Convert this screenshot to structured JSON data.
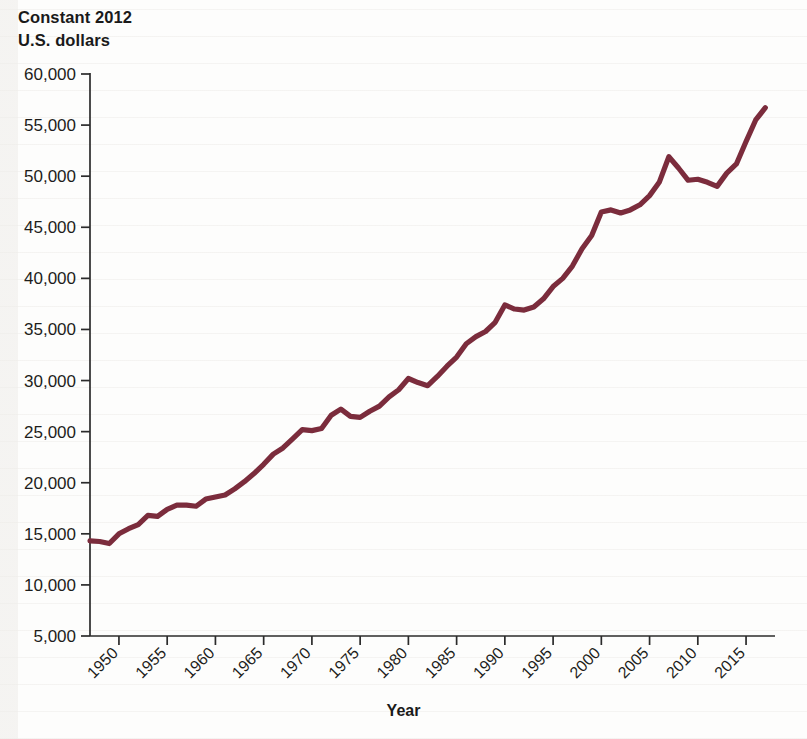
{
  "figure": {
    "y_axis_title": "Constant 2012\nU.S. dollars",
    "x_axis_title": "Year",
    "line_color": "#7b2c3c",
    "axis_color": "#2b2b2b",
    "background_color": "#fdfdfc"
  },
  "chart_data": {
    "type": "line",
    "title": "",
    "subtitle": "",
    "xlabel": "Year",
    "ylabel": "Constant 2012 U.S. dollars",
    "xlim": [
      1947,
      2018
    ],
    "ylim": [
      0,
      60000
    ],
    "grid": false,
    "legend": "none",
    "y_ticks": [
      5000,
      10000,
      15000,
      20000,
      25000,
      30000,
      35000,
      40000,
      45000,
      50000,
      55000,
      60000
    ],
    "y_tick_labels": [
      "5,000",
      "10,000",
      "15,000",
      "20,000",
      "25,000",
      "30,000",
      "35,000",
      "40,000",
      "45,000",
      "50,000",
      "55,000",
      "60,000"
    ],
    "x_ticks": [
      1950,
      1955,
      1960,
      1965,
      1970,
      1975,
      1980,
      1985,
      1990,
      1995,
      2000,
      2005,
      2010,
      2015
    ],
    "x_tick_labels": [
      "1950",
      "1955",
      "1960",
      "1965",
      "1970",
      "1975",
      "1980",
      "1985",
      "1990",
      "1995",
      "2000",
      "2005",
      "2010",
      "2015"
    ],
    "x_tick_rotation_deg": 45,
    "series": [
      {
        "name": "Median family income",
        "color": "#7b2c3c",
        "x": [
          1947,
          1948,
          1949,
          1950,
          1951,
          1952,
          1953,
          1954,
          1955,
          1956,
          1957,
          1958,
          1959,
          1960,
          1961,
          1962,
          1963,
          1964,
          1965,
          1966,
          1967,
          1968,
          1969,
          1970,
          1971,
          1972,
          1973,
          1974,
          1975,
          1976,
          1977,
          1978,
          1979,
          1980,
          1981,
          1982,
          1983,
          1984,
          1985,
          1986,
          1987,
          1988,
          1989,
          1990,
          1991,
          1992,
          1993,
          1994,
          1995,
          1996,
          1997,
          1998,
          1999,
          2000,
          2001,
          2002,
          2003,
          2004,
          2005,
          2006,
          2007,
          2008,
          2009,
          2010,
          2011,
          2012,
          2013,
          2014,
          2015,
          2016,
          2017
        ],
        "y": [
          14300,
          14250,
          14050,
          15000,
          15500,
          15900,
          16800,
          16700,
          17400,
          17800,
          17800,
          17700,
          18400,
          18600,
          18800,
          19400,
          20100,
          20900,
          21800,
          22800,
          23400,
          24300,
          25200,
          25100,
          25300,
          26600,
          27200,
          26500,
          26400,
          27000,
          27500,
          28400,
          29100,
          30200,
          29800,
          29500,
          30400,
          31400,
          32300,
          33600,
          34300,
          34800,
          35700,
          37400,
          37000,
          36900,
          37200,
          38000,
          39200,
          40000,
          41200,
          42900,
          44200,
          46500,
          46700,
          46400,
          46700,
          47200,
          48100,
          49400,
          51900,
          50800,
          49600,
          49700,
          49400,
          49000,
          50300,
          51200,
          53400,
          55500,
          56700
        ]
      }
    ],
    "annotations": [
      {
        "label": "post-war start",
        "x": 1947,
        "y": 14300
      },
      {
        "label": "early dip",
        "x": 1949,
        "y": 14050
      },
      {
        "label": "1980 local peak",
        "x": 1980,
        "y": 30200
      },
      {
        "label": "1982 recession trough",
        "x": 1982,
        "y": 29500
      },
      {
        "label": "1990 plateau",
        "x": 1990,
        "y": 37400
      },
      {
        "label": "2007 pre-recession peak",
        "x": 2007,
        "y": 51900
      },
      {
        "label": "2012 trough",
        "x": 2012,
        "y": 49000
      },
      {
        "label": "final value",
        "x": 2017,
        "y": 56700
      }
    ]
  }
}
